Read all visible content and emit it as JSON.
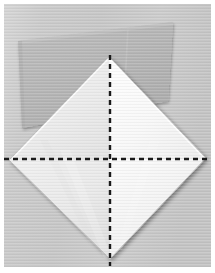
{
  "image": {
    "kind": "photograph",
    "subject": "origami-paper-fold-step",
    "width": 215,
    "height": 273,
    "description": "A white square sheet of paper rotated 45 degrees into a diamond, resting on a larger gray square sheet, with dashed black fold lines crossing vertically and horizontally through the center."
  },
  "colors": {
    "page_background": "#ffffff",
    "photo_background": "#c9c9c9",
    "photo_background_light": "#d4d4d4",
    "gray_sheet": "#b5b5b5",
    "gray_sheet_shadow": "#a8a8a8",
    "gray_sheet_light": "#c0c0c0",
    "white_sheet": "#fcfcfc",
    "white_sheet_shade_left": "#ededed",
    "white_sheet_shade_right": "#f4f4f4",
    "white_sheet_shade_bottom": "#e6e6e6",
    "fold_line": "#1a1a1a",
    "edge_line": "#9a9a9a",
    "border": "#ffffff"
  },
  "photo_frame": {
    "margin_left": 4,
    "margin_top": 4,
    "margin_right": 4,
    "margin_bottom": 6
  },
  "gray_sheet": {
    "name": "background-gray-square",
    "points": [
      [
        18,
        41
      ],
      [
        173,
        22
      ],
      [
        168,
        101
      ],
      [
        22,
        128
      ]
    ],
    "opacity": 1
  },
  "white_diamond": {
    "name": "white-paper-diamond",
    "top_vertex": [
      109,
      57
    ],
    "left_vertex": [
      9,
      160
    ],
    "right_vertex": [
      206,
      158
    ],
    "bottom_vertex": [
      110,
      259
    ]
  },
  "fold_lines": [
    {
      "name": "vertical-fold-line",
      "orientation": "vertical",
      "x": 110,
      "y_start": 55,
      "y_end": 266,
      "style": "dashed",
      "dash_length": 5,
      "dash_gap": 4,
      "thickness": 2.4
    },
    {
      "name": "horizontal-fold-line",
      "orientation": "horizontal",
      "y": 159,
      "x_start": 4,
      "x_end": 213,
      "style": "dashed",
      "dash_length": 5,
      "dash_gap": 4,
      "thickness": 2.4
    }
  ],
  "crease_edges": [
    {
      "name": "diamond-edge-top-left",
      "from": [
        109,
        57
      ],
      "to": [
        9,
        160
      ]
    },
    {
      "name": "diamond-edge-top-right",
      "from": [
        109,
        57
      ],
      "to": [
        206,
        158
      ]
    },
    {
      "name": "diamond-edge-bottom-left",
      "from": [
        9,
        160
      ],
      "to": [
        110,
        259
      ]
    },
    {
      "name": "diamond-edge-bottom-right",
      "from": [
        206,
        158
      ],
      "to": [
        110,
        259
      ]
    }
  ],
  "labels": {
    "none": ""
  }
}
